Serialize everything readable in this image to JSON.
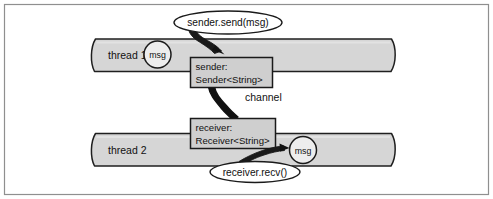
{
  "figure": {
    "frame": {
      "border_color": "#8c8c8c",
      "background": "#ffffff"
    },
    "palette": {
      "band_fill": "#d4d4d4",
      "box_fill": "#cfcfcf",
      "circle_fill": "#f2f2f2",
      "callout_fill": "#ffffff",
      "stroke": "#1a1a1a",
      "text": "#111111"
    }
  },
  "threads": [
    {
      "id": "thread-1",
      "label": "thread 1"
    },
    {
      "id": "thread-2",
      "label": "thread 2"
    }
  ],
  "messages": [
    {
      "id": "msg-thread-1",
      "label": "msg"
    },
    {
      "id": "msg-thread-2",
      "label": "msg"
    }
  ],
  "objects": [
    {
      "id": "sender-object",
      "name_line": "sender:",
      "type_line": "Sender<String>"
    },
    {
      "id": "receiver-object",
      "name_line": "receiver:",
      "type_line": "Receiver<String>"
    }
  ],
  "callouts": [
    {
      "id": "send-callout",
      "label": "sender.send(msg)"
    },
    {
      "id": "recv-callout",
      "label": "receiver.recv()"
    }
  ],
  "connectors": [
    {
      "id": "channel-connector",
      "label": "channel"
    }
  ]
}
